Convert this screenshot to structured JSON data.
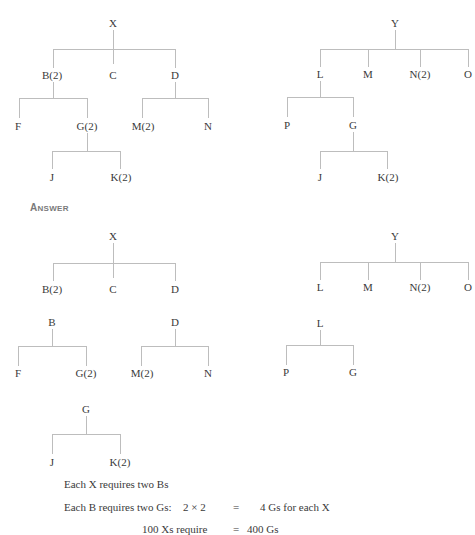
{
  "problem": {
    "tree_x": {
      "root": "X",
      "level1": [
        "B(2)",
        "C",
        "D"
      ],
      "b_children": [
        "F",
        "G(2)"
      ],
      "d_children": [
        "M(2)",
        "N"
      ],
      "g_children": [
        "J",
        "K(2)"
      ]
    },
    "tree_y": {
      "root": "Y",
      "level1": [
        "L",
        "M",
        "N(2)",
        "O"
      ],
      "l_children": [
        "P",
        "G"
      ],
      "g_children": [
        "J",
        "K(2)"
      ]
    }
  },
  "answer": {
    "heading_first": "A",
    "heading_rest": "NSWER",
    "x_level": {
      "root": "X",
      "children": [
        "B(2)",
        "C",
        "D"
      ]
    },
    "b_level": {
      "root": "B",
      "children": [
        "F",
        "G(2)"
      ]
    },
    "d_level": {
      "root": "D",
      "children": [
        "M(2)",
        "N"
      ]
    },
    "g_level": {
      "root": "G",
      "children": [
        "J",
        "K(2)"
      ]
    },
    "y_level": {
      "root": "Y",
      "children": [
        "L",
        "M",
        "N(2)",
        "O"
      ]
    },
    "l_level": {
      "root": "L",
      "children": [
        "P",
        "G"
      ]
    }
  },
  "calc": {
    "line1": "Each X requires two Bs",
    "line2_label": "Each B requires two Gs:",
    "line2_expr": "2 × 2",
    "line2_eq": "=",
    "line2_result": "4 Gs for each X",
    "line3_label": "100 Xs require",
    "line3_eq": "=",
    "line3_result": "400 Gs"
  }
}
